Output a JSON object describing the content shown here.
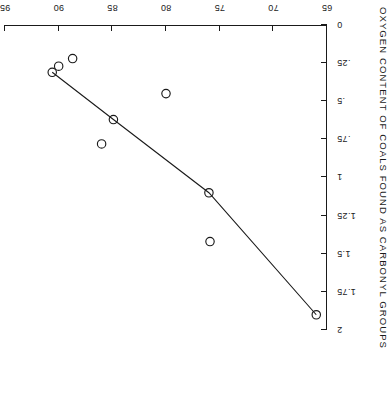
{
  "figure": {
    "orientation": "rotated-180",
    "ink_color": "#1a1a1a",
    "background_color": "#ffffff"
  },
  "chart_data": {
    "type": "scatter",
    "title": "",
    "xlabel": "CARBON CONTENT OF COALS",
    "ylabel": "OXYGEN CONTENT OF COALS FOUND AS CARBONYL GROUPS",
    "xlim": [
      65,
      95
    ],
    "ylim": [
      0,
      2
    ],
    "xticks": [
      65,
      70,
      75,
      80,
      85,
      90,
      95
    ],
    "xticklabels": [
      "65",
      "70",
      "75",
      "80",
      "85",
      "90",
      "95"
    ],
    "yticks": [
      0,
      0.25,
      0.5,
      0.75,
      1,
      1.25,
      1.5,
      1.75,
      2
    ],
    "yticklabels": [
      "0",
      ".25",
      ".5",
      ".75",
      "1",
      "1.25",
      "1.5",
      "1.75",
      "2"
    ],
    "grid": false,
    "legend": null,
    "marker": "open-circle",
    "points": [
      {
        "x": 66.0,
        "y": 1.9
      },
      {
        "x": 75.9,
        "y": 1.42
      },
      {
        "x": 76.0,
        "y": 1.1
      },
      {
        "x": 80.0,
        "y": 0.45
      },
      {
        "x": 84.9,
        "y": 0.62
      },
      {
        "x": 86.0,
        "y": 0.78
      },
      {
        "x": 88.7,
        "y": 0.22
      },
      {
        "x": 90.0,
        "y": 0.27
      },
      {
        "x": 90.6,
        "y": 0.31
      }
    ],
    "fit_line": [
      {
        "x": 66.0,
        "y": 1.9
      },
      {
        "x": 76.0,
        "y": 1.1
      },
      {
        "x": 84.9,
        "y": 0.62
      },
      {
        "x": 90.6,
        "y": 0.31
      }
    ]
  }
}
